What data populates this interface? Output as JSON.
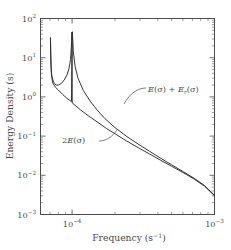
{
  "chart_data": {
    "type": "line",
    "title": "",
    "xlabel": "Frequency (s⁻¹)",
    "xlabel_base": "Frequency (s",
    "xlabel_exp": "−1",
    "xlabel_tail": ")",
    "ylabel": "Energy Density (s)",
    "xscale": "log",
    "yscale": "log",
    "xlim": [
      6e-05,
      0.001
    ],
    "ylim": [
      0.001,
      100.0
    ],
    "grid": false,
    "legend": "inline-annotations",
    "xticks": [
      {
        "value": 0.0001,
        "mantissa": "10",
        "exponent": "−4",
        "label": "10⁻⁴"
      },
      {
        "value": 0.001,
        "mantissa": "10",
        "exponent": "−3",
        "label": "10⁻³"
      }
    ],
    "yticks": [
      {
        "value": 100.0,
        "mantissa": "10",
        "exponent": "2",
        "label": "10²"
      },
      {
        "value": 10.0,
        "mantissa": "10",
        "exponent": "1",
        "label": "10¹"
      },
      {
        "value": 1.0,
        "mantissa": "10",
        "exponent": "0",
        "label": "10⁰"
      },
      {
        "value": 0.1,
        "mantissa": "10",
        "exponent": "−1",
        "label": "10⁻¹"
      },
      {
        "value": 0.01,
        "mantissa": "10",
        "exponent": "−2",
        "label": "10⁻²"
      },
      {
        "value": 0.001,
        "mantissa": "10",
        "exponent": "−3",
        "label": "10⁻³"
      }
    ],
    "annotations": [
      {
        "id": "upper-curve-label",
        "text": "E(σ) + Eᵣ(σ)",
        "parts": {
          "a": "E",
          "b": "(σ) + ",
          "c": "E",
          "sub": "r",
          "d": "(σ)"
        },
        "x_px": 148,
        "y_px": 90
      },
      {
        "id": "lower-curve-label",
        "text": "2E(σ)",
        "parts": {
          "a": "2",
          "b": "E",
          "c": "(σ)"
        },
        "x_px": 72,
        "y_px": 140
      }
    ],
    "series": [
      {
        "name": "E(σ) + Eᵣ(σ)",
        "description": "Total energy density with rotational contribution; two sharp resonance spikes near 7e-5 and 1e-4, then a broad decay merging with 2E at high frequency.",
        "color": "#2b2b2b",
        "points": [
          [
            7.05e-05,
            32.0
          ],
          [
            7.08e-05,
            12.0
          ],
          [
            7.12e-05,
            6.0
          ],
          [
            7.2e-05,
            3.4
          ],
          [
            7.4e-05,
            2.4
          ],
          [
            7.7e-05,
            2.0
          ],
          [
            8e-05,
            2.0
          ],
          [
            8.4e-05,
            2.2
          ],
          [
            8.8e-05,
            2.7
          ],
          [
            9.2e-05,
            3.6
          ],
          [
            9.5e-05,
            5.2
          ],
          [
            9.75e-05,
            9.0
          ],
          [
            9.9e-05,
            22.0
          ],
          [
            9.98e-05,
            45.0
          ],
          [
            0.0001004,
            46.0
          ],
          [
            0.000102,
            14.0
          ],
          [
            0.000105,
            6.0
          ],
          [
            0.00011,
            3.0
          ],
          [
            0.00012,
            1.45
          ],
          [
            0.000135,
            0.75
          ],
          [
            0.00015,
            0.46
          ],
          [
            0.00017,
            0.28
          ],
          [
            0.0002,
            0.165
          ],
          [
            0.00024,
            0.1
          ],
          [
            0.00029,
            0.063
          ],
          [
            0.00035,
            0.041
          ],
          [
            0.00042,
            0.027
          ],
          [
            0.0005,
            0.0185
          ],
          [
            0.0006,
            0.0125
          ],
          [
            0.00072,
            0.0084
          ],
          [
            0.00085,
            0.0055
          ],
          [
            0.001,
            0.0031
          ]
        ]
      },
      {
        "name": "2E(σ)",
        "description": "Twice the base energy density; single narrow spike at 1e-4 dropping steeply, then smooth monotonic decay converging with the upper curve.",
        "color": "#2b2b2b",
        "points": [
          [
            7.05e-05,
            32.0
          ],
          [
            7.08e-05,
            10.0
          ],
          [
            7.15e-05,
            4.0
          ],
          [
            7.3e-05,
            2.3
          ],
          [
            7.6e-05,
            1.8
          ],
          [
            8e-05,
            1.5
          ],
          [
            8.6e-05,
            1.15
          ],
          [
            9.2e-05,
            0.92
          ],
          [
            9.9e-05,
            0.76
          ],
          [
            0.0001,
            45.0
          ],
          [
            0.0001002,
            0.7
          ],
          [
            0.000105,
            0.61
          ],
          [
            0.000115,
            0.46
          ],
          [
            0.00013,
            0.33
          ],
          [
            0.00015,
            0.23
          ],
          [
            0.000175,
            0.155
          ],
          [
            0.0002,
            0.115
          ],
          [
            0.00024,
            0.076
          ],
          [
            0.00029,
            0.051
          ],
          [
            0.00035,
            0.035
          ],
          [
            0.00042,
            0.024
          ],
          [
            0.0005,
            0.017
          ],
          [
            0.0006,
            0.0118
          ],
          [
            0.00072,
            0.008
          ],
          [
            0.00085,
            0.0053
          ],
          [
            0.001,
            0.003
          ]
        ]
      }
    ]
  },
  "figure": {
    "background": "#ffffff",
    "axis_color": "#4d4d4d",
    "line_color": "#2b2b2b",
    "text_color": "#4a4a4a"
  }
}
